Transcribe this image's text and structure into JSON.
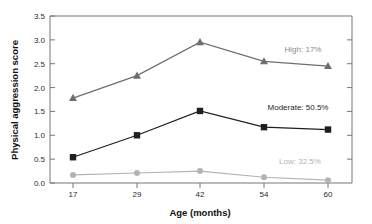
{
  "chart_data": {
    "type": "line",
    "title": "",
    "xlabel": "Age (months)",
    "ylabel": "Physical aggression score",
    "x": [
      17,
      29,
      42,
      54,
      60
    ],
    "xtick_labels": [
      "17",
      "29",
      "42",
      "54",
      "60"
    ],
    "ytick_labels": [
      "0.0",
      "0.5",
      "1.0",
      "1.5",
      "2.0",
      "2.5",
      "3.0",
      "3.5"
    ],
    "ytick_values": [
      0.0,
      0.5,
      1.0,
      1.5,
      2.0,
      2.5,
      3.0,
      3.5
    ],
    "ylim": [
      0.0,
      3.5
    ],
    "grid": false,
    "legend_position": "inline-right",
    "series": [
      {
        "name": "High: 17%",
        "short_name": "High",
        "percent": "17%",
        "marker": "triangle",
        "color": "#6e6e6e",
        "values": [
          1.78,
          2.25,
          2.95,
          2.55,
          2.45
        ],
        "label_text": "High: 17%"
      },
      {
        "name": "Moderate: 50.5%",
        "short_name": "Moderate",
        "percent": "50.5%",
        "marker": "square",
        "color": "#1f1f1f",
        "values": [
          0.54,
          1.0,
          1.51,
          1.17,
          1.12
        ],
        "label_text": "Moderate: 50.5%"
      },
      {
        "name": "Low: 32.5%",
        "short_name": "Low",
        "percent": "32.5%",
        "marker": "circle",
        "color": "#b3b3b3",
        "values": [
          0.17,
          0.21,
          0.25,
          0.12,
          0.06
        ],
        "label_text": "Low: 32.5%"
      }
    ],
    "annotations": [
      {
        "text": "High: 17%",
        "x_px": 303,
        "y_px": 52,
        "color": "#8a8a8a"
      },
      {
        "text": "Moderate: 50.5%",
        "x_px": 298,
        "y_px": 110,
        "color": "#1f1f1f"
      },
      {
        "text": "Low: 32.5%",
        "x_px": 300,
        "y_px": 164,
        "color": "#b3b3b3"
      }
    ]
  },
  "axes": {
    "y_axis_title": "Physical aggression score",
    "x_axis_title": "Age (months)"
  }
}
